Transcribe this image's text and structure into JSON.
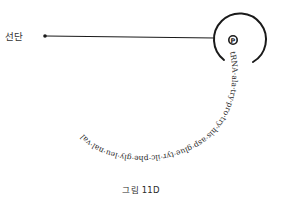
{
  "diagram": {
    "start_label": "선단",
    "site_symbol": "P",
    "chain_text": "tRNA·ala·try·pro·try·his·asp·glue·tyr·ilc·phe·gly·leu·nal·val",
    "caption": "그림 11D",
    "colors": {
      "ink": "#1a1a1a",
      "background": "#ffffff"
    }
  }
}
